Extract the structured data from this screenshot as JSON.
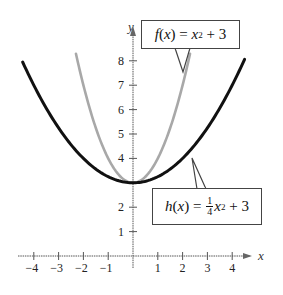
{
  "chart_data": {
    "type": "line",
    "title": "",
    "xlabel": "x",
    "ylabel": "y",
    "xlim": [
      -4.4,
      4.9
    ],
    "ylim": [
      0,
      8.7
    ],
    "grid": false,
    "x_ticks": [
      -4,
      -3,
      -2,
      -1,
      1,
      2,
      3,
      4
    ],
    "x_tick_labels": [
      "−4",
      "−3",
      "−2",
      "−1",
      "1",
      "2",
      "3",
      "4"
    ],
    "y_ticks": [
      1,
      2,
      4,
      5,
      6,
      7,
      8
    ],
    "y_tick_labels": [
      "1",
      "2",
      "4",
      "5",
      "6",
      "7",
      "8"
    ],
    "series": [
      {
        "name": "f(x) = x^2 + 3",
        "expression": "x^2 + 3",
        "color": "#a8a8a8",
        "x_range": [
          -2.3,
          2.3
        ],
        "x": [
          -2.3,
          -2,
          -1.5,
          -1,
          -0.5,
          0,
          0.5,
          1,
          1.5,
          2,
          2.3
        ],
        "values": [
          8.29,
          7,
          5.25,
          4,
          3.25,
          3,
          3.25,
          4,
          5.25,
          7,
          8.29
        ]
      },
      {
        "name": "h(x) = 1/4 x^2 + 3",
        "expression": "0.25*x^2 + 3",
        "color": "#111111",
        "x_range": [
          -4.45,
          4.5
        ],
        "x": [
          -4.45,
          -4,
          -3,
          -2,
          -1,
          0,
          1,
          2,
          3,
          4,
          4.5
        ],
        "values": [
          7.95,
          7,
          5.25,
          4,
          3.25,
          3,
          3.25,
          4,
          5.25,
          7,
          8.06
        ]
      }
    ],
    "annotations": [
      {
        "text": "f(x) = x² + 3",
        "points_to": "f",
        "box": "top-center"
      },
      {
        "text": "h(x) = ¼x² + 3",
        "points_to": "h",
        "box": "lower-right"
      }
    ]
  },
  "labels": {
    "f": {
      "fn": "f",
      "var": "x",
      "eq": " = ",
      "term": "x",
      "exp": "2",
      "rest": " + 3"
    },
    "h": {
      "fn": "h",
      "var": "x",
      "eq": " = ",
      "num": "1",
      "den": "4",
      "term": "x",
      "exp": "2",
      "rest": " + 3"
    }
  }
}
